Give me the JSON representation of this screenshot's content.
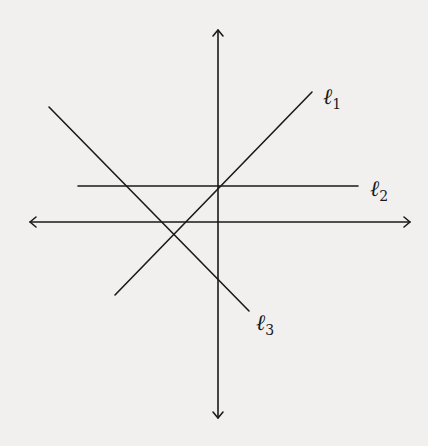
{
  "diagram": {
    "title": "",
    "background": "#f1f0ee",
    "stroke": "#1a1a1a",
    "axes": {
      "x_axis": {
        "x1": 30,
        "y1": 222,
        "x2": 410,
        "y2": 222,
        "arrows": "both"
      },
      "y_axis": {
        "x1": 218,
        "y1": 30,
        "x2": 218,
        "y2": 418,
        "arrows": "both"
      }
    },
    "lines": [
      {
        "id": "l1",
        "label": "ℓ",
        "subscript": "1",
        "x1": 115,
        "y1": 295,
        "x2": 312,
        "y2": 92,
        "label_x": 323,
        "label_y": 104
      },
      {
        "id": "l2",
        "label": "ℓ",
        "subscript": "2",
        "x1": 78,
        "y1": 186,
        "x2": 358,
        "y2": 186,
        "label_x": 370,
        "label_y": 196
      },
      {
        "id": "l3",
        "label": "ℓ",
        "subscript": "3",
        "x1": 49,
        "y1": 107,
        "x2": 249,
        "y2": 311,
        "label_x": 256,
        "label_y": 330
      }
    ]
  }
}
